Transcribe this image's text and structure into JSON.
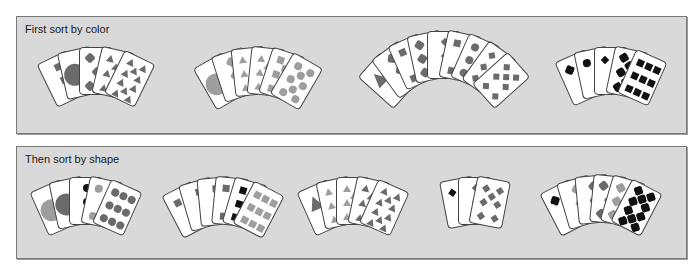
{
  "colors": {
    "black": "#111111",
    "dark": "#6b6b6b",
    "light": "#9e9e9e",
    "panel_bg": "#d9d9d9",
    "card_bg": "#ffffff"
  },
  "panels": [
    {
      "title": "First sort by color",
      "box": {
        "left": 16,
        "top": 16,
        "width": 671,
        "height": 118
      },
      "fans": [
        {
          "name": "fan-dark-mixed",
          "cx": 95,
          "top": 30,
          "spread": 13,
          "cards": [
            {
              "shape": "square",
              "count": 3,
              "color": "dark"
            },
            {
              "shape": "big-circle",
              "count": 1,
              "color": "dark"
            },
            {
              "shape": "clover",
              "count": 5,
              "color": "dark"
            },
            {
              "shape": "triangle",
              "count": 8,
              "color": "dark"
            },
            {
              "shape": "triangle",
              "count": 10,
              "color": "dark"
            }
          ]
        },
        {
          "name": "fan-light-mixed",
          "cx": 257,
          "top": 30,
          "spread": 12,
          "cards": [
            {
              "shape": "big-circle",
              "count": 1,
              "color": "light"
            },
            {
              "shape": "clover",
              "count": 3,
              "color": "light"
            },
            {
              "shape": "triangle",
              "count": 6,
              "color": "light"
            },
            {
              "shape": "triangle",
              "count": 7,
              "color": "light"
            },
            {
              "shape": "square",
              "count": 8,
              "color": "light"
            },
            {
              "shape": "circle",
              "count": 8,
              "color": "light"
            }
          ]
        },
        {
          "name": "fan-dark-mixed-2",
          "cx": 443,
          "top": 14,
          "spread": 12,
          "cards": [
            {
              "shape": "big-triangle",
              "count": 2,
              "color": "dark"
            },
            {
              "shape": "clover",
              "count": 3,
              "color": "dark"
            },
            {
              "shape": "square",
              "count": 4,
              "color": "dark"
            },
            {
              "shape": "clover",
              "count": 6,
              "color": "dark"
            },
            {
              "shape": "diamond",
              "count": 3,
              "color": "dark"
            },
            {
              "shape": "square",
              "count": 4,
              "color": "dark"
            },
            {
              "shape": "circle",
              "count": 6,
              "color": "dark"
            },
            {
              "shape": "diamond",
              "count": 6,
              "color": "dark"
            },
            {
              "shape": "diamond",
              "count": 7,
              "color": "dark"
            }
          ]
        },
        {
          "name": "fan-black-mixed",
          "cx": 610,
          "top": 30,
          "spread": 12,
          "cards": [
            {
              "shape": "clover",
              "count": 2,
              "color": "black"
            },
            {
              "shape": "circle",
              "count": 2,
              "color": "black"
            },
            {
              "shape": "diamond",
              "count": 2,
              "color": "black"
            },
            {
              "shape": "clover",
              "count": 8,
              "color": "black"
            },
            {
              "shape": "square",
              "count": 9,
              "color": "black"
            }
          ]
        }
      ]
    },
    {
      "title": "Then sort by shape",
      "box": {
        "left": 16,
        "top": 146,
        "width": 671,
        "height": 113
      },
      "fans": [
        {
          "name": "fan-circles",
          "cx": 85,
          "top": 30,
          "spread": 12,
          "cards": [
            {
              "shape": "big-circle",
              "count": 1,
              "color": "light"
            },
            {
              "shape": "big-circle",
              "count": 1,
              "color": "dark"
            },
            {
              "shape": "circle",
              "count": 3,
              "color": "black"
            },
            {
              "shape": "circle",
              "count": 4,
              "color": "light"
            },
            {
              "shape": "circle",
              "count": 9,
              "color": "dark"
            }
          ]
        },
        {
          "name": "fan-squares",
          "cx": 222,
          "top": 30,
          "spread": 11,
          "cards": [
            {
              "shape": "square",
              "count": 2,
              "color": "dark"
            },
            {
              "shape": "square",
              "count": 3,
              "color": "dark"
            },
            {
              "shape": "square",
              "count": 3,
              "color": "dark"
            },
            {
              "shape": "square",
              "count": 4,
              "color": "dark"
            },
            {
              "shape": "square",
              "count": 6,
              "color": "black"
            },
            {
              "shape": "square",
              "count": 9,
              "color": "light"
            }
          ]
        },
        {
          "name": "fan-triangles",
          "cx": 352,
          "top": 30,
          "spread": 12,
          "cards": [
            {
              "shape": "big-triangle",
              "count": 2,
              "color": "dark"
            },
            {
              "shape": "triangle",
              "count": 6,
              "color": "light"
            },
            {
              "shape": "triangle",
              "count": 7,
              "color": "light"
            },
            {
              "shape": "triangle",
              "count": 8,
              "color": "dark"
            },
            {
              "shape": "triangle",
              "count": 10,
              "color": "dark"
            }
          ]
        },
        {
          "name": "fan-diamonds",
          "cx": 474,
          "top": 30,
          "spread": 11,
          "cards": [
            {
              "shape": "diamond",
              "count": 2,
              "color": "black"
            },
            {
              "shape": "diamond",
              "count": 3,
              "color": "dark"
            },
            {
              "shape": "diamond",
              "count": 7,
              "color": "dark"
            }
          ]
        },
        {
          "name": "fan-clovers",
          "cx": 600,
          "top": 28,
          "spread": 11,
          "cards": [
            {
              "shape": "clover",
              "count": 2,
              "color": "black"
            },
            {
              "shape": "clover",
              "count": 3,
              "color": "light"
            },
            {
              "shape": "clover",
              "count": 3,
              "color": "dark"
            },
            {
              "shape": "clover",
              "count": 5,
              "color": "dark"
            },
            {
              "shape": "clover",
              "count": 6,
              "color": "light"
            },
            {
              "shape": "clover",
              "count": 10,
              "color": "black"
            }
          ]
        }
      ]
    }
  ]
}
